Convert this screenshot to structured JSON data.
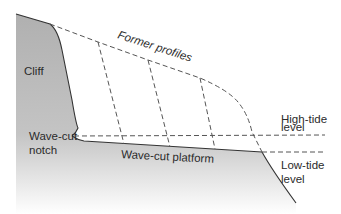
{
  "diagram": {
    "labels": {
      "cliff": "Cliff",
      "former_profiles": "Former profiles",
      "notch_line1": "Wave-cut",
      "notch_line2": "notch",
      "platform": "Wave-cut platform",
      "high_tide_line1": "High-tide",
      "high_tide_line2": "level",
      "low_tide_line1": "Low-tide",
      "low_tide_line2": "level"
    },
    "colors": {
      "rock_fill": "#b3b3b3",
      "rock_fade": "#ffffff",
      "outline": "#333333",
      "dashed": "#555555",
      "text": "#2b2b2b",
      "background": "#ffffff"
    }
  }
}
